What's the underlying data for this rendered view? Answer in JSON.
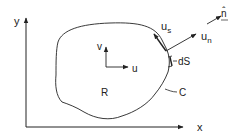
{
  "diagram": {
    "type": "boundary-region-vector-diagram",
    "colors": {
      "stroke": "#222222",
      "background": "#ffffff"
    },
    "axes": {
      "x_label": "x",
      "y_label": "y"
    },
    "region": {
      "label": "R",
      "boundary_label": "C"
    },
    "interior_vectors": {
      "horizontal_label": "u",
      "vertical_label": "v"
    },
    "boundary_vectors": {
      "tangential_label_main": "u",
      "tangential_label_sub": "s",
      "normal_label_main": "u",
      "normal_label_sub": "n",
      "unit_normal_label": "n̂"
    },
    "element": {
      "label": "dS"
    }
  }
}
